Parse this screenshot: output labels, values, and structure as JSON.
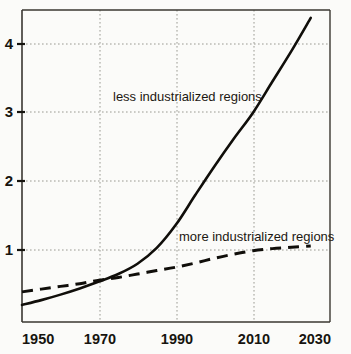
{
  "chart_data": {
    "type": "line",
    "title": "",
    "subtitle": "",
    "xlabel": "",
    "ylabel": "",
    "xlim": [
      1950,
      2030
    ],
    "ylim": [
      0,
      4.6
    ],
    "grid": true,
    "grid_style": "dotted",
    "legend_position": "inline-annotations",
    "x_ticks": [
      "1950",
      "1970",
      "1990",
      "2010",
      "2030"
    ],
    "x_tick_values": [
      1950,
      1970,
      1990,
      2010,
      2030
    ],
    "y_ticks": [
      "1",
      "2",
      "3",
      "4"
    ],
    "y_tick_values": [
      1,
      2,
      3,
      4
    ],
    "series": [
      {
        "name": "less industrialized regions",
        "style": "solid",
        "color": "#100e0a",
        "x": [
          1950,
          1955,
          1960,
          1965,
          1970,
          1975,
          1980,
          1985,
          1990,
          1995,
          2000,
          2005,
          2010,
          2015,
          2020,
          2025
        ],
        "values": [
          0.2,
          0.27,
          0.35,
          0.44,
          0.54,
          0.65,
          0.8,
          1.03,
          1.37,
          1.8,
          2.22,
          2.62,
          3.0,
          3.45,
          3.9,
          4.38
        ]
      },
      {
        "name": "more industrialized regions",
        "style": "dashed",
        "color": "#100e0a",
        "x": [
          1950,
          1955,
          1960,
          1965,
          1970,
          1975,
          1980,
          1985,
          1990,
          1995,
          2000,
          2005,
          2010,
          2015,
          2020,
          2025
        ],
        "values": [
          0.39,
          0.43,
          0.47,
          0.51,
          0.56,
          0.6,
          0.65,
          0.7,
          0.75,
          0.81,
          0.88,
          0.94,
          0.99,
          1.02,
          1.04,
          1.06
        ]
      }
    ],
    "annotations": [
      {
        "text": "less industrialized regions",
        "x": 1976,
        "y": 3.12,
        "anchor": "start"
      },
      {
        "text": "more industrialized regions",
        "x": 1993,
        "y": 1.2,
        "anchor": "start"
      }
    ],
    "colors": {
      "axis": "#2a2722",
      "grid": "#9a9a92",
      "background": "#fbfbf9",
      "text": "#16140f"
    }
  }
}
